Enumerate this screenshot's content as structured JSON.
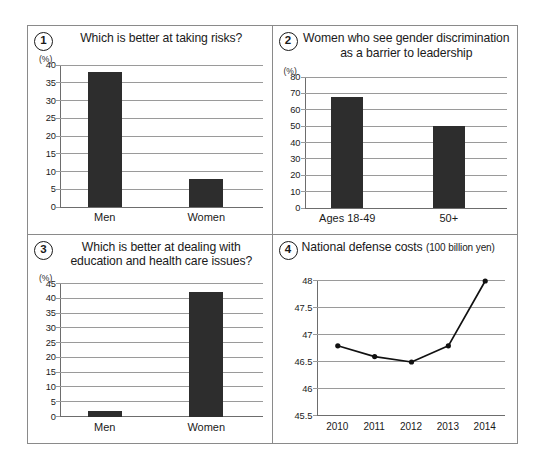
{
  "chart_data": [
    {
      "id": 1,
      "number": "1",
      "type": "bar",
      "title": "Which is better at taking risks?",
      "unit_label": "(%)",
      "categories": [
        "Men",
        "Women"
      ],
      "values": [
        38,
        8
      ],
      "ylim": [
        0,
        40
      ],
      "yticks": [
        0,
        5,
        10,
        15,
        20,
        25,
        30,
        35,
        40
      ],
      "ytick_labels": [
        "0",
        "5",
        "10",
        "15",
        "20",
        "25",
        "30",
        "35",
        "40"
      ],
      "xlabel": "",
      "ylabel": "",
      "grid": true,
      "legend": "none",
      "bar_color": "#2d2d2d"
    },
    {
      "id": 2,
      "number": "2",
      "type": "bar",
      "title": "Women who see gender discrimination as a barrier to leadership",
      "unit_label": "(%)",
      "categories": [
        "Ages 18-49",
        "50+"
      ],
      "values": [
        68,
        50
      ],
      "ylim": [
        0,
        80
      ],
      "yticks": [
        0,
        10,
        20,
        30,
        40,
        50,
        60,
        70,
        80
      ],
      "ytick_labels": [
        "0",
        "10",
        "20",
        "30",
        "40",
        "50",
        "60",
        "70",
        "80"
      ],
      "xlabel": "",
      "ylabel": "",
      "grid": true,
      "legend": "none",
      "bar_color": "#2d2d2d"
    },
    {
      "id": 3,
      "number": "3",
      "type": "bar",
      "title": "Which is better at dealing with education and health care issues?",
      "unit_label": "(%)",
      "categories": [
        "Men",
        "Women"
      ],
      "values": [
        2,
        42
      ],
      "ylim": [
        0,
        45
      ],
      "yticks": [
        0,
        5,
        10,
        15,
        20,
        25,
        30,
        35,
        40,
        45
      ],
      "ytick_labels": [
        "0",
        "5",
        "10",
        "15",
        "20",
        "25",
        "30",
        "35",
        "40",
        "45"
      ],
      "xlabel": "",
      "ylabel": "",
      "grid": true,
      "legend": "none",
      "bar_color": "#2d2d2d"
    },
    {
      "id": 4,
      "number": "4",
      "type": "line",
      "title": "National defense costs",
      "title_unit": "(100 billion yen)",
      "unit_label": "",
      "x": [
        "2010",
        "2011",
        "2012",
        "2013",
        "2014"
      ],
      "values": [
        46.8,
        46.6,
        46.5,
        46.8,
        48.0
      ],
      "ylim": [
        45.5,
        48
      ],
      "yticks": [
        45.5,
        46,
        46.5,
        47,
        47.5,
        48
      ],
      "ytick_labels": [
        "45.5",
        "46",
        "46.5",
        "47",
        "47.5",
        "48"
      ],
      "xlabel": "",
      "ylabel": "",
      "grid": true,
      "legend": "none",
      "line_color": "#111111",
      "marker_color": "#111111"
    }
  ],
  "panels": [
    {
      "number_glyph": "1"
    },
    {
      "number_glyph": "2"
    },
    {
      "number_glyph": "3"
    },
    {
      "number_glyph": "4"
    }
  ]
}
